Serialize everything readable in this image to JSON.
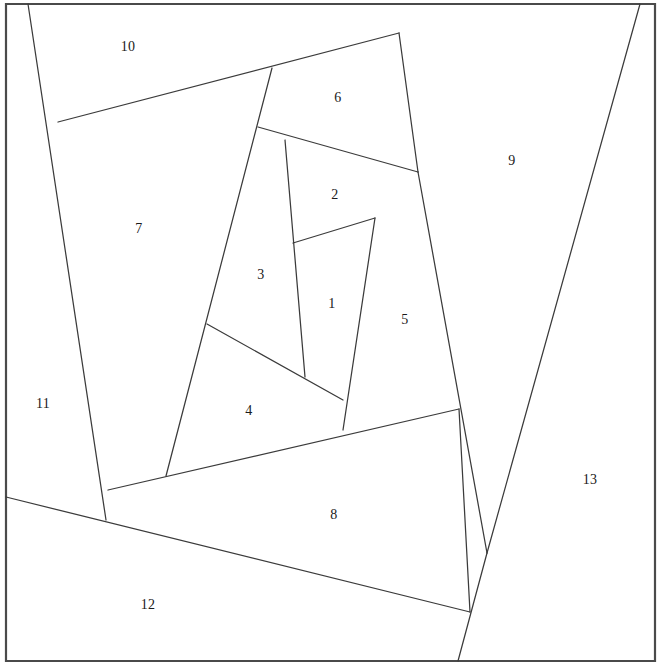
{
  "canvas": {
    "width": 662,
    "height": 671,
    "background": "#ffffff",
    "title": "Partitioned Rectangle Diagram"
  },
  "style": {
    "frame_color": "#4a4a4a",
    "frame_width": 2.2,
    "line_color": "#3b3b3b",
    "line_width": 1.25,
    "label_color": "#1a1a1a",
    "label_size": 14
  },
  "frame": {
    "name": "outer-border",
    "left": 6,
    "top": 4,
    "right": 655,
    "bottom": 661,
    "path": "M 6 4 L 655 4 L 655 661 L 6 661 Z"
  },
  "partition_lines": [
    {
      "id": "line-a",
      "name": "border-10-11-left-descender",
      "path": "M 28 4 L 106 520"
    },
    {
      "id": "line-b",
      "name": "border-10-7-upper-diagonal",
      "path": "M 58 122 L 399 33"
    },
    {
      "id": "line-c",
      "name": "border-7-3-left-spine",
      "path": "M 272 68 L 166 476"
    },
    {
      "id": "line-d",
      "name": "border-6-9-right-spine",
      "path": "M 399 33 L 418 172"
    },
    {
      "id": "line-e",
      "name": "border-6-2-3-crossbar",
      "path": "M 258 127 L 418 172"
    },
    {
      "id": "line-f",
      "name": "border-3-2-vertical",
      "path": "M 285 140 L 305 377"
    },
    {
      "id": "line-g",
      "name": "border-2-1-short-diagonal",
      "path": "M 293 243 L 375 218"
    },
    {
      "id": "line-h",
      "name": "border-1-5-vertical",
      "path": "M 375 218 L 343 430"
    },
    {
      "id": "line-i",
      "name": "border-5-9-long-spine",
      "path": "M 418 172 L 487 553"
    },
    {
      "id": "line-j",
      "name": "border-9-13-right-diagonal",
      "path": "M 640 4 L 487 553"
    },
    {
      "id": "line-k",
      "name": "border-3-4-diagonal",
      "path": "M 207 324 L 343 400"
    },
    {
      "id": "line-l",
      "name": "border-4-8-lower-diagonal",
      "path": "M 108 490 L 459 409"
    },
    {
      "id": "line-m",
      "name": "border-8-12-long-diagonal",
      "path": "M 6 497 L 470 612"
    },
    {
      "id": "line-n",
      "name": "border-12-13-bottom-descender",
      "path": "M 487 553 L 458 661"
    },
    {
      "id": "line-o",
      "name": "border-8-13-lower-right",
      "path": "M 459 409 L 470 612"
    }
  ],
  "regions": [
    {
      "id": 1,
      "label": "1",
      "x": 332,
      "y": 305,
      "name": "region-1",
      "hit": "M 305 377 L 293 243 L 375 218 L 343 430 Z"
    },
    {
      "id": 2,
      "label": "2",
      "x": 335,
      "y": 196,
      "name": "region-2",
      "hit": "M 285 140 L 418 172 L 375 218 L 293 243 Z"
    },
    {
      "id": 3,
      "label": "3",
      "x": 261,
      "y": 276,
      "name": "region-3",
      "hit": "M 258 127 L 285 140 L 305 377 L 207 324 Z"
    },
    {
      "id": 4,
      "label": "4",
      "x": 249,
      "y": 412,
      "name": "region-4",
      "hit": "M 207 324 L 343 400 L 166 476 L 108 490 Z"
    },
    {
      "id": 5,
      "label": "5",
      "x": 405,
      "y": 321,
      "name": "region-5",
      "hit": "M 375 218 L 418 172 L 487 553 L 343 430 Z"
    },
    {
      "id": 6,
      "label": "6",
      "x": 338,
      "y": 99,
      "name": "region-6",
      "hit": "M 272 68 L 399 33 L 418 172 L 258 127 Z"
    },
    {
      "id": 7,
      "label": "7",
      "x": 139,
      "y": 230,
      "name": "region-7",
      "hit": "M 58 122 L 272 68 L 166 476 L 106 520 Z"
    },
    {
      "id": 8,
      "label": "8",
      "x": 334,
      "y": 516,
      "name": "region-8",
      "hit": "M 108 490 L 459 409 L 470 612 L 6 497 Z"
    },
    {
      "id": 9,
      "label": "9",
      "x": 512,
      "y": 162,
      "name": "region-9",
      "hit": "M 399 33 L 640 4 L 487 553 L 418 172 Z"
    },
    {
      "id": 10,
      "label": "10",
      "x": 128,
      "y": 48,
      "name": "region-10",
      "hit": "M 28 4 L 399 33 L 58 122 Z"
    },
    {
      "id": 11,
      "label": "11",
      "x": 43,
      "y": 405,
      "name": "region-11",
      "hit": "M 28 4 L 106 520 L 6 497 L 6 4 Z"
    },
    {
      "id": 12,
      "label": "12",
      "x": 148,
      "y": 606,
      "name": "region-12",
      "hit": "M 6 497 L 470 612 L 458 661 L 6 661 Z"
    },
    {
      "id": 13,
      "label": "13",
      "x": 590,
      "y": 481,
      "name": "region-13",
      "hit": "M 640 4 L 655 4 L 655 661 L 458 661 L 487 553 Z"
    }
  ]
}
